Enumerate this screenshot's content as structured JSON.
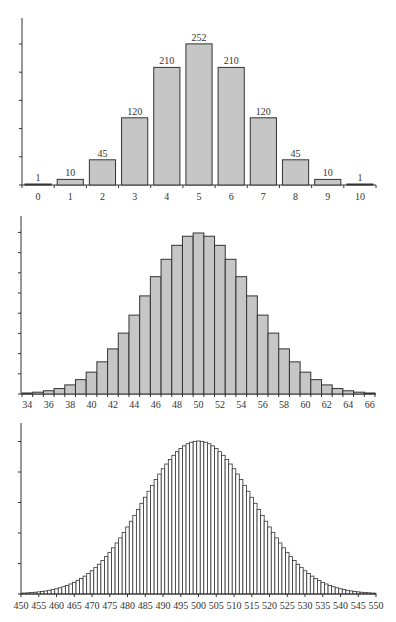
{
  "chart_data": [
    {
      "type": "bar",
      "title": "",
      "xlabel": "",
      "ylabel": "",
      "categories": [
        "0",
        "1",
        "2",
        "3",
        "4",
        "5",
        "6",
        "7",
        "8",
        "9",
        "10"
      ],
      "values": [
        1,
        10,
        45,
        120,
        210,
        252,
        210,
        120,
        45,
        10,
        1
      ],
      "data_labels": [
        "1",
        "10",
        "45",
        "120",
        "210",
        "252",
        "210",
        "120",
        "45",
        "10",
        "1"
      ],
      "ylim": [
        0,
        300
      ],
      "y_ticks_count": 6,
      "y_tick_labels": [],
      "bar_color": "#c6c6c6",
      "grid": false,
      "legend": null
    },
    {
      "type": "bar",
      "title": "",
      "xlabel": "",
      "ylabel": "",
      "x": [
        34,
        35,
        36,
        37,
        38,
        39,
        40,
        41,
        42,
        43,
        44,
        45,
        46,
        47,
        48,
        49,
        50,
        51,
        52,
        53,
        54,
        55,
        56,
        57,
        58,
        59,
        60,
        61,
        62,
        63,
        64,
        65,
        66
      ],
      "tick_labels": [
        "34",
        "36",
        "38",
        "40",
        "42",
        "44",
        "46",
        "48",
        "50",
        "52",
        "54",
        "56",
        "58",
        "60",
        "62",
        "64",
        "66"
      ],
      "values": [
        0.0005,
        0.0009,
        0.0016,
        0.0027,
        0.0045,
        0.0071,
        0.0108,
        0.0159,
        0.0223,
        0.0301,
        0.039,
        0.0485,
        0.058,
        0.0666,
        0.0735,
        0.078,
        0.0796,
        0.078,
        0.0735,
        0.0666,
        0.058,
        0.0485,
        0.039,
        0.0301,
        0.0223,
        0.0159,
        0.0108,
        0.0071,
        0.0045,
        0.0027,
        0.0016,
        0.0009,
        0.0005
      ],
      "ylim": [
        0,
        0.088
      ],
      "y_ticks_count": 9,
      "y_tick_labels": [],
      "bar_color": "#c6c6c6",
      "grid": false,
      "legend": null
    },
    {
      "type": "bar",
      "title": "",
      "xlabel": "",
      "ylabel": "",
      "x_start": 450,
      "x_end": 550,
      "tick_labels": [
        "450",
        "455",
        "460",
        "465",
        "470",
        "475",
        "480",
        "485",
        "490",
        "495",
        "500",
        "505",
        "510",
        "515",
        "520",
        "525",
        "530",
        "535",
        "540",
        "545",
        "550"
      ],
      "values": [
        0.000127,
        0.000157,
        0.000193,
        0.000236,
        0.000287,
        0.000349,
        0.000422,
        0.000508,
        0.000608,
        0.000726,
        0.000863,
        0.001022,
        0.001204,
        0.001413,
        0.001651,
        0.00192,
        0.002224,
        0.002565,
        0.002945,
        0.003367,
        0.003833,
        0.004345,
        0.004903,
        0.00551,
        0.006164,
        0.006867,
        0.007617,
        0.008414,
        0.009254,
        0.010135,
        0.011049,
        0.011997,
        0.012967,
        0.013956,
        0.014953,
        0.015952,
        0.016944,
        0.017918,
        0.018868,
        0.019781,
        0.020652,
        0.021431,
        0.02218,
        0.022861,
        0.023468,
        0.023993,
        0.02443,
        0.024775,
        0.025024,
        0.025175,
        0.025225,
        0.025175,
        0.025024,
        0.024775,
        0.02443,
        0.023993,
        0.023468,
        0.022861,
        0.02218,
        0.021431,
        0.020652,
        0.019781,
        0.018868,
        0.017918,
        0.016944,
        0.015952,
        0.014953,
        0.013956,
        0.012967,
        0.011997,
        0.011049,
        0.010135,
        0.009254,
        0.008414,
        0.007617,
        0.006867,
        0.006164,
        0.00551,
        0.004903,
        0.004345,
        0.003833,
        0.003367,
        0.002945,
        0.002565,
        0.002224,
        0.00192,
        0.001651,
        0.001413,
        0.001204,
        0.001022,
        0.000863,
        0.000726,
        0.000608,
        0.000508,
        0.000422,
        0.000349,
        0.000287,
        0.000236,
        0.000193,
        0.000157,
        0.000127
      ],
      "ylim": [
        0,
        0.0264
      ],
      "y_ticks_count": 6,
      "y_tick_labels": [],
      "bar_color": "#ffffff",
      "grid": false,
      "legend": null
    }
  ]
}
